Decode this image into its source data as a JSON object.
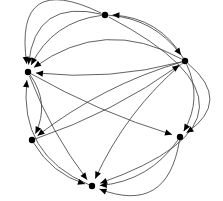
{
  "figure": {
    "type": "directed-graph",
    "width": 223,
    "height": 201,
    "background_color": "#ffffff",
    "edge_color": "#3a3a3a",
    "node_color": "#000000",
    "arrowhead_color": "#000000",
    "node_radius": 3.2,
    "edge_stroke_width": 0.8,
    "node_count": 6,
    "edge_count": 20
  },
  "graph_data": {
    "type": "directed-graph",
    "nodes": [
      {
        "id": "n0",
        "label": "",
        "x": 105,
        "y": 15
      },
      {
        "id": "n1",
        "label": "",
        "x": 185,
        "y": 61
      },
      {
        "id": "n2",
        "label": "",
        "x": 180,
        "y": 137
      },
      {
        "id": "n3",
        "label": "",
        "x": 92,
        "y": 186
      },
      {
        "id": "n4",
        "label": "",
        "x": 32,
        "y": 140
      },
      {
        "id": "n5",
        "label": "",
        "x": 28,
        "y": 72
      }
    ],
    "edges": [
      {
        "source": "n1",
        "target": "n5",
        "curve": -0.1
      },
      {
        "source": "n1",
        "target": "n5",
        "curve": 0.34
      },
      {
        "source": "n1",
        "target": "n0",
        "curve": 0.3
      },
      {
        "source": "n1",
        "target": "n4",
        "curve": 0.1
      },
      {
        "source": "n1",
        "target": "n3",
        "curve": 0.12
      },
      {
        "source": "n1",
        "target": "n2",
        "curve": -0.3
      },
      {
        "source": "n1",
        "target": "n2",
        "curve": -0.72
      },
      {
        "source": "n0",
        "target": "n1",
        "curve": -0.26
      },
      {
        "source": "n0",
        "target": "n5",
        "curve": 0.3
      },
      {
        "source": "n0",
        "target": "n5",
        "curve": 0.62
      },
      {
        "source": "n0",
        "target": "n5",
        "curve": 1.0
      },
      {
        "source": "n0",
        "target": "n3",
        "curve": -1.18
      },
      {
        "source": "n5",
        "target": "n4",
        "curve": -0.34
      },
      {
        "source": "n5",
        "target": "n3",
        "curve": 0.08
      },
      {
        "source": "n5",
        "target": "n2",
        "curve": 0.06
      },
      {
        "source": "n4",
        "target": "n3",
        "curve": 0.22
      },
      {
        "source": "n4",
        "target": "n1",
        "curve": 0.08
      },
      {
        "source": "n2",
        "target": "n3",
        "curve": -0.26
      },
      {
        "source": "n2",
        "target": "n3",
        "curve": -0.66
      },
      {
        "source": "n3",
        "target": "n5",
        "curve": -0.4
      }
    ]
  }
}
